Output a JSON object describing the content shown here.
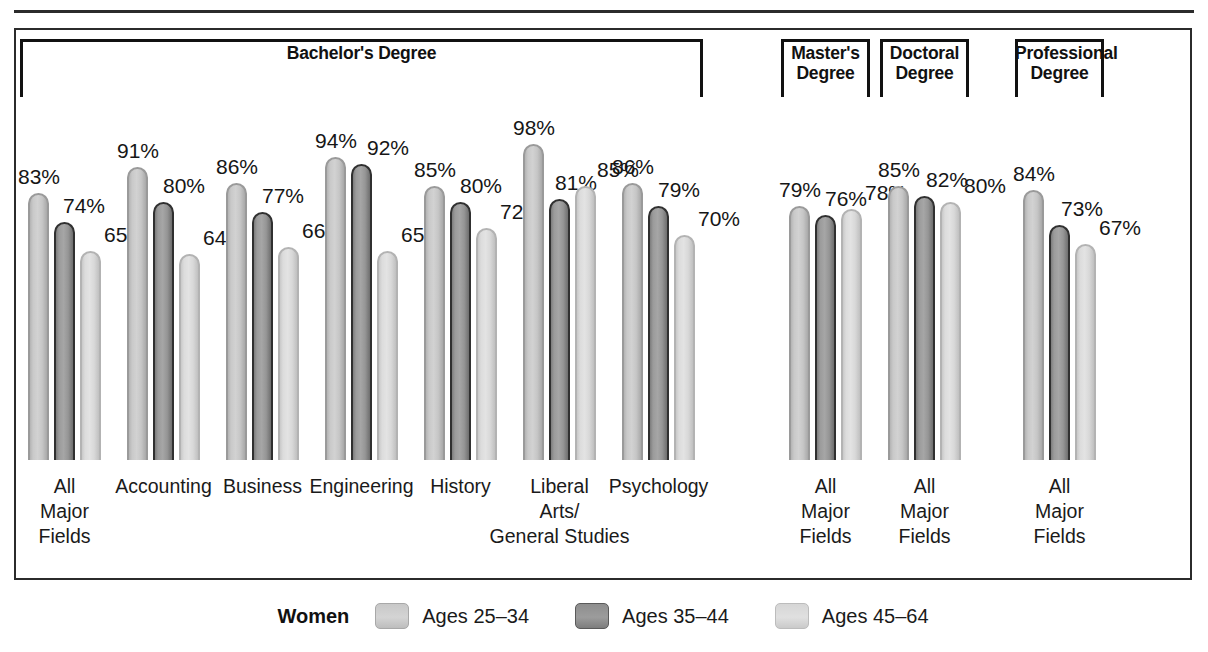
{
  "chart_data": {
    "type": "bar",
    "title": "",
    "xlabel": "",
    "ylabel": "",
    "ylim": [
      0,
      100
    ],
    "grid": false,
    "legend_position": "bottom",
    "legend_title": "Women",
    "series": [
      {
        "name": "Ages 25–34",
        "values": [
          83,
          91,
          86,
          94,
          85,
          98,
          86,
          79,
          85,
          84
        ]
      },
      {
        "name": "Ages 35–44",
        "values": [
          74,
          80,
          77,
          92,
          80,
          81,
          79,
          76,
          82,
          73
        ]
      },
      {
        "name": "Ages 45–64",
        "values": [
          65,
          64,
          66,
          65,
          72,
          85,
          70,
          78,
          80,
          67
        ]
      }
    ],
    "categories": [
      "All Major Fields",
      "Accounting",
      "Business",
      "Engineering",
      "History",
      "Liberal Arts/ General Studies",
      "Psychology",
      "All Major Fields",
      "All Major Fields",
      "All Major Fields"
    ],
    "value_suffix": "%",
    "groups": [
      {
        "label": "Bachelor's Degree",
        "categories": [
          0,
          1,
          2,
          3,
          4,
          5,
          6
        ]
      },
      {
        "label": "Master's Degree",
        "categories": [
          7
        ]
      },
      {
        "label": "Doctoral Degree",
        "categories": [
          8
        ]
      },
      {
        "label": "Professional Degree",
        "categories": [
          9
        ]
      }
    ]
  },
  "groups": [
    {
      "label_line1": "Bachelor's Degree",
      "label_line2": ""
    },
    {
      "label_line1": "Master's",
      "label_line2": "Degree"
    },
    {
      "label_line1": "Doctoral",
      "label_line2": "Degree"
    },
    {
      "label_line1": "Professional",
      "label_line2": "Degree"
    }
  ],
  "categories": [
    {
      "line1": "All",
      "line2": "Major",
      "line3": "Fields"
    },
    {
      "line1": "Accounting",
      "line2": "",
      "line3": ""
    },
    {
      "line1": "Business",
      "line2": "",
      "line3": ""
    },
    {
      "line1": "Engineering",
      "line2": "",
      "line3": ""
    },
    {
      "line1": "History",
      "line2": "",
      "line3": ""
    },
    {
      "line1": "Liberal",
      "line2": "Arts/",
      "line3": "General Studies"
    },
    {
      "line1": "Psychology",
      "line2": "",
      "line3": ""
    },
    {
      "line1": "All",
      "line2": "Major",
      "line3": "Fields"
    },
    {
      "line1": "All",
      "line2": "Major",
      "line3": "Fields"
    },
    {
      "line1": "All",
      "line2": "Major",
      "line3": "Fields"
    }
  ],
  "bar_values": [
    [
      "83%",
      "74%",
      "65%"
    ],
    [
      "91%",
      "80%",
      "64%"
    ],
    [
      "86%",
      "77%",
      "66%"
    ],
    [
      "94%",
      "92%",
      "65%"
    ],
    [
      "85%",
      "80%",
      "72%"
    ],
    [
      "98%",
      "81%",
      "85%"
    ],
    [
      "86%",
      "79%",
      "70%"
    ],
    [
      "79%",
      "76%",
      "78%"
    ],
    [
      "85%",
      "82%",
      "80%"
    ],
    [
      "84%",
      "73%",
      "67%"
    ]
  ],
  "legend": {
    "title": "Women",
    "items": [
      {
        "label": "Ages 25–34"
      },
      {
        "label": "Ages 35–44"
      },
      {
        "label": "Ages 45–64"
      }
    ]
  },
  "colors": {
    "series_25_34": "#d2d2d2",
    "series_35_44": "#9b9b9b",
    "series_45_64": "#e0e0e0",
    "frame": "#2b2b2b",
    "text": "#1a1a1a"
  }
}
